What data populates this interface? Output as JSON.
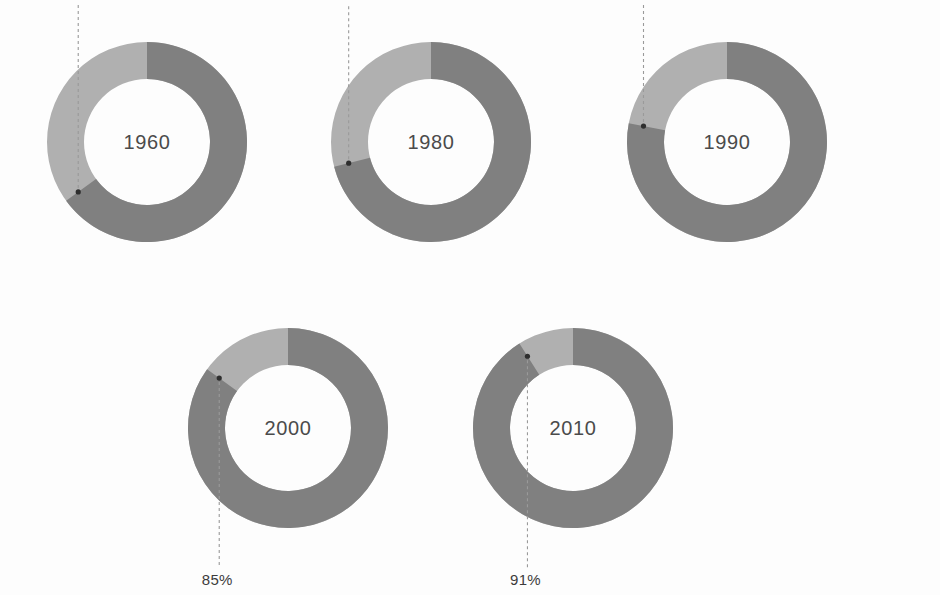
{
  "chart_data": {
    "type": "pie",
    "title": "",
    "subtitle": "",
    "xlabel": "",
    "ylabel": "",
    "grid": false,
    "legend_position": "none",
    "variant": "donut-grid",
    "units": "percent",
    "series_names": [
      "Share",
      "Remainder"
    ],
    "categories": [
      "1960",
      "1980",
      "1990",
      "2000",
      "2010"
    ],
    "values": [
      65,
      71,
      78,
      85,
      91
    ],
    "value_labels": [
      "65%",
      "71%",
      "78%",
      "85%",
      "91%"
    ],
    "remainder_values": [
      35,
      29,
      22,
      15,
      9
    ],
    "slice_colors": [
      "#808080",
      "#b0b0b0"
    ],
    "donuts": [
      {
        "year": "1960",
        "percent": 65,
        "percent_label": "65%",
        "remainder": 35,
        "label_position": "top"
      },
      {
        "year": "1980",
        "percent": 71,
        "percent_label": "71%",
        "remainder": 29,
        "label_position": "top"
      },
      {
        "year": "1990",
        "percent": 78,
        "percent_label": "78%",
        "remainder": 22,
        "label_position": "top"
      },
      {
        "year": "2000",
        "percent": 85,
        "percent_label": "85%",
        "remainder": 15,
        "label_position": "bottom"
      },
      {
        "year": "2010",
        "percent": 91,
        "percent_label": "91%",
        "remainder": 9,
        "label_position": "bottom"
      }
    ]
  },
  "style": {
    "background": "#fdfdfd",
    "dark_segment": "#808080",
    "light_segment": "#b0b0b0",
    "year_text": "#4b4b4b",
    "percent_text": "#3c3c3c",
    "leader_line": "#9a9a9a",
    "marker_dot": "#2e2e2e"
  },
  "layout": {
    "rows": [
      {
        "donut_indices": [
          0,
          1,
          2
        ]
      },
      {
        "donut_indices": [
          3,
          4
        ]
      }
    ]
  }
}
